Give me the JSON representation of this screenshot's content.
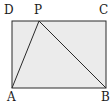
{
  "diagram": {
    "type": "geometry-figure",
    "colors": {
      "fill": "#ebebeb",
      "stroke": "#2a2a2a",
      "label": "#1a1a1a"
    },
    "points": {
      "A": {
        "x": 12,
        "y": 88
      },
      "B": {
        "x": 106,
        "y": 88
      },
      "C": {
        "x": 106,
        "y": 21
      },
      "D": {
        "x": 12,
        "y": 21
      },
      "P": {
        "x": 39,
        "y": 21
      }
    },
    "labels": [
      {
        "id": "D",
        "text": "D",
        "x": 4,
        "y": 14
      },
      {
        "id": "P",
        "text": "P",
        "x": 34,
        "y": 14
      },
      {
        "id": "C",
        "text": "C",
        "x": 99,
        "y": 14
      },
      {
        "id": "A",
        "text": "A",
        "x": 7,
        "y": 101
      },
      {
        "id": "B",
        "text": "B",
        "x": 101,
        "y": 101
      }
    ],
    "segments": [
      {
        "from": "A",
        "to": "B"
      },
      {
        "from": "B",
        "to": "C"
      },
      {
        "from": "C",
        "to": "D"
      },
      {
        "from": "D",
        "to": "A"
      },
      {
        "from": "A",
        "to": "P"
      },
      {
        "from": "P",
        "to": "B"
      }
    ]
  }
}
